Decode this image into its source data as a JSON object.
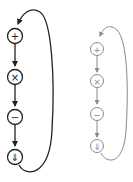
{
  "diagrams": [
    {
      "name": "cycle-dark",
      "color": "#222222",
      "operations": [
        {
          "symbol": "+",
          "meaning": "add"
        },
        {
          "symbol": "×",
          "meaning": "multiply"
        },
        {
          "symbol": "−",
          "meaning": "subtract"
        },
        {
          "symbol": "⇓",
          "meaning": "down-arrow"
        }
      ]
    },
    {
      "name": "cycle-light",
      "color": "#8a8a8a",
      "operations": [
        {
          "symbol": "+",
          "meaning": "add"
        },
        {
          "symbol": "×",
          "meaning": "multiply"
        },
        {
          "symbol": "−",
          "meaning": "subtract"
        },
        {
          "symbol": "⇓",
          "meaning": "down-arrow"
        }
      ]
    }
  ]
}
